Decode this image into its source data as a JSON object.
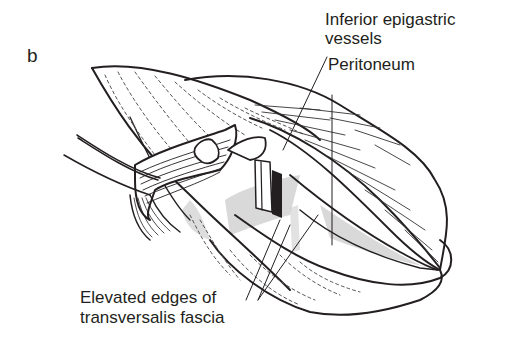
{
  "figure": {
    "panel_letter": "b",
    "labels": {
      "inferior_epigastric_line1": "Inferior epigastric",
      "inferior_epigastric_line2": "vessels",
      "peritoneum": "Peritoneum",
      "transversalis_line1": "Elevated edges of",
      "transversalis_line2": "transversalis fascia"
    },
    "colors": {
      "ink": "#231f20",
      "shade": "#c8c8c8",
      "background": "#ffffff"
    }
  }
}
